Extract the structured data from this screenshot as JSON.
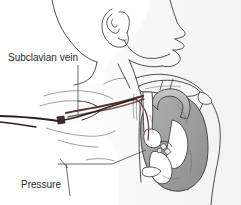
{
  "figure": {
    "type": "medical-line-illustration",
    "background_color": "#ffffff",
    "view": "left lateral profile of head, neck, shoulder and chest"
  },
  "labels": {
    "subclavian_vein": {
      "text": "Subclavian vein",
      "lines": [
        "Subclavian vein"
      ],
      "color": "#2b2b2b",
      "align": "left"
    },
    "pressure_monitor": {
      "text": "Pressure monitor above right atrium",
      "lines": [
        "Pressure",
        "monitor",
        "above right",
        "atrium"
      ],
      "line1": "Pressure",
      "line2": "monitor",
      "line3": "above right",
      "line4": "atrium",
      "color": "#2b2b2b",
      "align": "center"
    }
  },
  "anatomy": {
    "parts": [
      "head-profile",
      "ear",
      "nose",
      "lips",
      "chin",
      "jawline",
      "neck",
      "clavicle",
      "shoulder",
      "upper-arm",
      "chest-wall",
      "ribs",
      "heart",
      "aortic-arch",
      "superior-vena-cava",
      "right-atrium",
      "subclavian-vein"
    ],
    "outline_color": "#3c3c3c",
    "heart_fill": "#9a9a9a",
    "heart_fill_light": "#c4c4c4",
    "chamber_fill": "#ffffff",
    "vessel_color": "#5a3030",
    "catheter_color": "#2e2020"
  },
  "devices": {
    "catheter": {
      "name": "central venous catheter",
      "entry": "left subclavian vein",
      "tip_location": "above right atrium",
      "hub_label": "connector hub"
    }
  },
  "colors": {
    "background": "#ffffff",
    "ink": "#3c3c3c",
    "text": "#2b2b2b",
    "leader": "#4a4a4a",
    "gray_fill": "#9a9a9a",
    "vessel": "#5a3030"
  }
}
